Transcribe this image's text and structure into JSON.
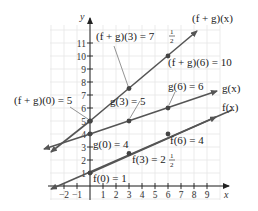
{
  "chart_data": {
    "type": "line",
    "title": "",
    "xlabel": "x",
    "ylabel": "y",
    "xlim": [
      -2,
      9
    ],
    "ylim": [
      0,
      11
    ],
    "grid": true,
    "x_ticks": [
      "−2",
      "−1",
      "1",
      "2",
      "3",
      "4",
      "5",
      "6",
      "7",
      "8",
      "9"
    ],
    "y_ticks": [
      "1",
      "2",
      "3",
      "4",
      "5",
      "6",
      "7",
      "8",
      "9",
      "10",
      "11"
    ],
    "series": [
      {
        "name": "f(x)",
        "equation": "f(x) = x/2 + 1",
        "x": [
          0,
          3,
          6
        ],
        "values": [
          1,
          2.5,
          4
        ],
        "label": "f(x)"
      },
      {
        "name": "g(x)",
        "equation": "g(x) = x/3 + 4",
        "x": [
          0,
          3,
          6
        ],
        "values": [
          4,
          5,
          6
        ],
        "label": "g(x)"
      },
      {
        "name": "(f + g)(x)",
        "equation": "(f+g)(x) = 5x/6 + 5",
        "x": [
          0,
          3,
          6
        ],
        "values": [
          5,
          7.5,
          10
        ],
        "label": "(f + g)(x)"
      }
    ],
    "annotations": [
      "f(0) = 1",
      "f(3) = 2½",
      "f(6) = 4",
      "g(0) = 4",
      "g(3) = 5",
      "g(6) = 6",
      "(f + g)(0) = 5",
      "(f + g)(3) = 7½",
      "(f + g)(6) = 10"
    ]
  },
  "labels": {
    "f0": "f(0) = 1",
    "f3_main": "f(3) = 2",
    "f3_num": "1",
    "f3_den": "2",
    "f6": "f(6) = 4",
    "g0": "g(0) = 4",
    "g3": "g(3) = 5",
    "g6": "g(6) = 6",
    "fg0": "(f + g)(0) = 5",
    "fg3_main": "(f + g)(3) = 7",
    "fg3_num": "1",
    "fg3_den": "2",
    "fg6": "(f + g)(6) = 10",
    "fx": "f(x)",
    "gx": "g(x)",
    "fgx": "(f + g)(x)",
    "x_axis": "x",
    "y_axis": "y"
  },
  "colors": {
    "line": "#555555",
    "point": "#444444",
    "axis": "#222222",
    "grid": "#e6e6e6"
  }
}
